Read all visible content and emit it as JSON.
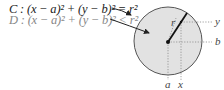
{
  "equations": {
    "C": "C : (x − a)² + (y − b)² = r²",
    "D": "D : (x − a)² + (y − b)² < r²"
  },
  "labels": {
    "r": "r",
    "y": "y",
    "b": "b",
    "a": "a",
    "x": "x"
  },
  "colors": {
    "disk_fill": "#e2e2e2",
    "circle_stroke": "#555555",
    "text_C": "#222222",
    "text_D": "#888888"
  }
}
